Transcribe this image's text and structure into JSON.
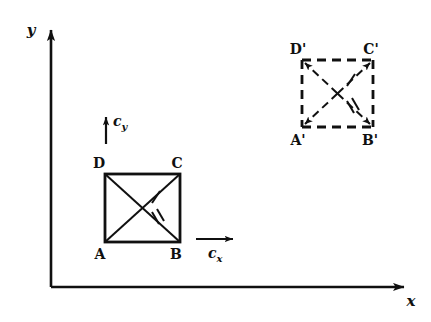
{
  "figure": {
    "background_color": "#ffffff",
    "stroke_color": "#101010",
    "width": 431,
    "height": 322
  },
  "axes": {
    "x_label": "x",
    "y_label": "y",
    "origin": {
      "x": 51,
      "y": 287
    },
    "x_axis_end": {
      "x": 412,
      "y": 287
    },
    "y_axis_end": {
      "x": 51,
      "y": 22
    },
    "arrowheads": "both-ends-outward"
  },
  "vectors": [
    {
      "name": "c-y-vector",
      "label": "c",
      "subscript": "y",
      "direction": "up",
      "tail": {
        "x": 106,
        "y": 144
      },
      "tip": {
        "x": 106,
        "y": 110
      },
      "label_position": {
        "x": 113,
        "y": 126
      }
    },
    {
      "name": "c-x-vector",
      "label": "c",
      "subscript": "x",
      "direction": "right",
      "tail": {
        "x": 196,
        "y": 239
      },
      "tip": {
        "x": 240,
        "y": 239
      },
      "label_position": {
        "x": 214,
        "y": 258
      }
    }
  ],
  "squares": [
    {
      "name": "square-abcd",
      "line_style": "solid",
      "has_corner_arrows": false,
      "bounds": {
        "left": 105,
        "top": 174,
        "right": 180,
        "bottom": 242
      },
      "vertices": [
        {
          "id": "A",
          "label": "A",
          "corner": "bottom-left",
          "x": 105,
          "y": 242,
          "label_x": 100,
          "label_y": 258
        },
        {
          "id": "B",
          "label": "B",
          "corner": "bottom-right",
          "x": 180,
          "y": 242,
          "label_x": 175,
          "label_y": 258
        },
        {
          "id": "C",
          "label": "C",
          "corner": "top-right",
          "x": 180,
          "y": 174,
          "label_x": 175,
          "label_y": 168
        },
        {
          "id": "D",
          "label": "D",
          "corner": "top-left",
          "x": 105,
          "y": 174,
          "label_x": 100,
          "label_y": 168
        }
      ],
      "diagonals": [
        {
          "name": "diagonal-a-c",
          "from": "A",
          "to": "C",
          "ticks": 1,
          "tick_at": {
            "x": 156,
            "y": 197
          }
        },
        {
          "name": "diagonal-d-b",
          "from": "D",
          "to": "B",
          "ticks": 2,
          "tick_at": {
            "x": 157,
            "y": 219
          }
        }
      ]
    },
    {
      "name": "square-abcd-primed",
      "line_style": "dashed",
      "has_corner_arrows": true,
      "bounds": {
        "left": 302,
        "top": 60,
        "right": 373,
        "bottom": 127
      },
      "vertices": [
        {
          "id": "A'",
          "label": "A'",
          "corner": "bottom-left",
          "x": 302,
          "y": 127,
          "label_x": 297,
          "label_y": 144
        },
        {
          "id": "B'",
          "label": "B'",
          "corner": "bottom-right",
          "x": 373,
          "y": 127,
          "label_x": 367,
          "label_y": 144
        },
        {
          "id": "C'",
          "label": "C'",
          "corner": "top-right",
          "x": 373,
          "y": 60,
          "label_x": 367,
          "label_y": 53
        },
        {
          "id": "D'",
          "label": "D'",
          "corner": "top-left",
          "x": 302,
          "y": 60,
          "label_x": 296,
          "label_y": 53
        }
      ],
      "diagonals": [
        {
          "name": "diagonal-a-c-primed",
          "from": "A'",
          "to": "C'",
          "ticks": 1,
          "tick_at": {
            "x": 351,
            "y": 80
          }
        },
        {
          "name": "diagonal-d-b-primed",
          "from": "D'",
          "to": "B'",
          "ticks": 2,
          "tick_at": {
            "x": 352,
            "y": 107
          }
        }
      ]
    }
  ]
}
